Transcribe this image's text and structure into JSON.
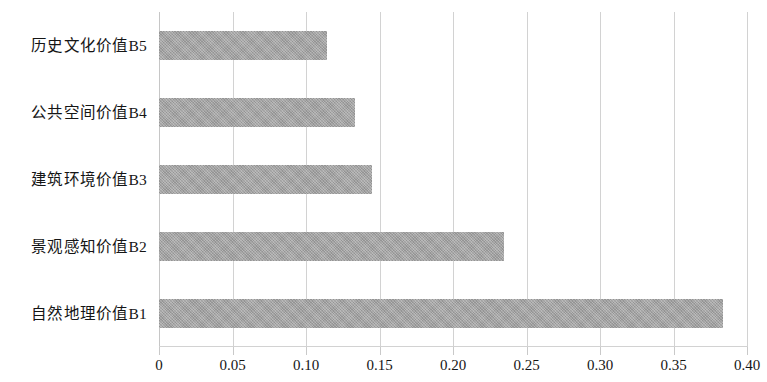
{
  "chart_data": {
    "type": "bar",
    "orientation": "horizontal",
    "title": "",
    "subtitle": "",
    "xlabel": "",
    "ylabel": "",
    "categories": [
      "自然地理价值B1",
      "景观感知价值B2",
      "建筑环境价值B3",
      "公共空间价值B4",
      "历史文化价值B5"
    ],
    "values": [
      0.384,
      0.235,
      0.145,
      0.133,
      0.114
    ],
    "series": [
      {
        "name": "权重",
        "values": [
          0.384,
          0.235,
          0.145,
          0.133,
          0.114
        ]
      }
    ],
    "xlim": [
      0,
      0.4
    ],
    "ylim": null,
    "xticks": [
      0,
      0.05,
      0.1,
      0.15,
      0.2,
      0.25,
      0.3,
      0.35,
      0.4
    ],
    "xtick_labels": [
      "0",
      "0.05",
      "0.10",
      "0.15",
      "0.20",
      "0.25",
      "0.30",
      "0.35",
      "0.40"
    ],
    "grid": "vertical",
    "legend": null,
    "legend_position": "none",
    "annotations": [],
    "bar_color": "#a2a2a2",
    "gridline_color": "#d2d2d2",
    "text_color": "#151515",
    "background_color": "#ffffff"
  },
  "bars_top_to_bottom": [
    {
      "label": "历史文化价值B5",
      "value": 0.114
    },
    {
      "label": "公共空间价值B4",
      "value": 0.133
    },
    {
      "label": "建筑环境价值B3",
      "value": 0.145
    },
    {
      "label": "景观感知价值B2",
      "value": 0.235
    },
    {
      "label": "自然地理价值B1",
      "value": 0.384
    }
  ]
}
